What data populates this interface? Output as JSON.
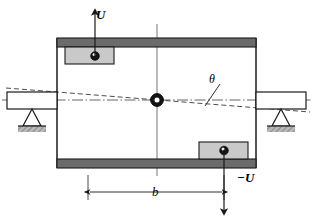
{
  "figure": {
    "labels": {
      "velocity_up": "U",
      "velocity_down": "−U",
      "dimension_b": "b",
      "angle_theta": "θ"
    },
    "colors": {
      "bar_fill": "#6b6b6b",
      "bar_stroke": "#1a1a1a",
      "block_fill": "#c9c9c9",
      "block_stroke": "#1a1a1a",
      "pin_fill": "#1a1a1a",
      "line": "#1a1a1a",
      "hatch_fill": "#b0b0b0",
      "centerline": "#555555",
      "background": "#ffffff"
    },
    "elements": {
      "top_bar": "top-thick-bar",
      "bottom_bar": "bottom-thick-bar",
      "left_wall": "frame-left-wall",
      "right_wall": "frame-right-wall",
      "top_slider": "upper-slider-block",
      "bottom_slider": "lower-slider-block",
      "center_pivot": "center-pivot-hub",
      "left_support": "left-pin-support",
      "right_support": "right-pin-support",
      "tilted_axis": "tilted-dashed-axis",
      "horizontal_axis": "horizontal-dash-dot-centerline",
      "vertical_axis": "vertical-centerline",
      "dimension_line": "dimension-line-b"
    }
  }
}
